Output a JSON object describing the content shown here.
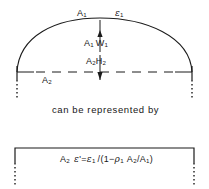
{
  "figure": {
    "title_text": "",
    "caption": "can be represented by",
    "ink_color": "#1b1b1b",
    "background": "#ffffff",
    "labels": {
      "area_top": "A",
      "area_top_sub": "1",
      "emissivity_top": "ε",
      "emissivity_top_sub": "1",
      "flux_up_1": "A",
      "flux_up_1_sub": "1",
      "flux_up_2": "W",
      "flux_up_2_sub": "1",
      "flux_down_1": "A",
      "flux_down_1_sub": "2",
      "flux_down_2": "H",
      "flux_down_2_sub": "2",
      "area_bottom": "A",
      "area_bottom_sub": "2"
    },
    "formula": {
      "lhs_symbol": "A",
      "lhs_sub": "2",
      "eps_prime": "ε",
      "eps_prime_mark": "'",
      "equals": "=",
      "num_symbol": "ε",
      "num_sub": "1",
      "slash": "/(1−",
      "rho_symbol": "ρ",
      "rho_sub": "1",
      "ratio_num": "A",
      "ratio_num_sub": "2",
      "ratio_div": "/A",
      "ratio_den_sub": "1",
      "close": ")",
      "plain": "A2 ε' = ε1 /(1− ρ1 A2/A1)"
    },
    "geometry": {
      "arc_apex_x": 100,
      "arc_apex_y": 18,
      "arc_left_x": 17,
      "arc_right_x": 192,
      "baseline_y": 72,
      "box_left_x": 15,
      "box_right_x": 194,
      "box_top_y": 148
    }
  }
}
